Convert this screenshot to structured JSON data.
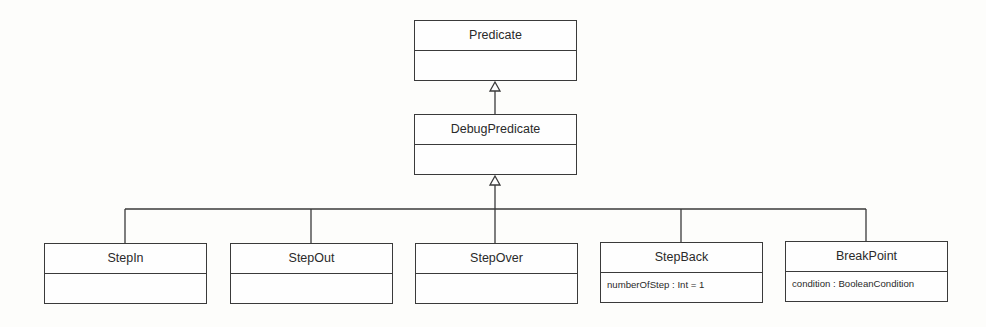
{
  "diagram": {
    "type": "uml-class-inheritance",
    "classes": [
      {
        "id": "predicate",
        "name": "Predicate",
        "attributes": []
      },
      {
        "id": "debug-predicate",
        "name": "DebugPredicate",
        "attributes": [],
        "extends": "Predicate"
      },
      {
        "id": "step-in",
        "name": "StepIn",
        "attributes": [],
        "extends": "DebugPredicate"
      },
      {
        "id": "step-out",
        "name": "StepOut",
        "attributes": [],
        "extends": "DebugPredicate"
      },
      {
        "id": "step-over",
        "name": "StepOver",
        "attributes": [],
        "extends": "DebugPredicate"
      },
      {
        "id": "step-back",
        "name": "StepBack",
        "attributes": [
          "numberOfStep : Int = 1"
        ],
        "extends": "DebugPredicate"
      },
      {
        "id": "break-point",
        "name": "BreakPoint",
        "attributes": [
          "condition : BooleanCondition"
        ],
        "extends": "DebugPredicate"
      }
    ],
    "colors": {
      "line": "#3a3a3a",
      "background": "#fdfdfb"
    }
  }
}
